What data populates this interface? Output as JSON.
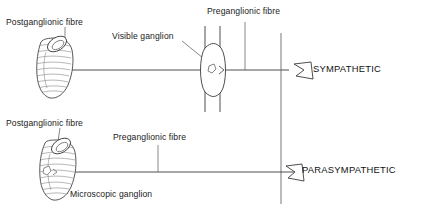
{
  "diagram": {
    "stroke_color": "#3a3a3a",
    "text_color": "#1a1a1a",
    "background_color": "#ffffff",
    "rows": [
      {
        "id": "sympathetic",
        "system_label": "SYMPATHETIC",
        "labels": {
          "postganglionic": "Postganglionic fibre",
          "preganglionic": "Preganglionic fibre",
          "ganglion": "Visible ganglion"
        },
        "ganglion_type": "visible",
        "ganglion_position": "remote from organ"
      },
      {
        "id": "parasympathetic",
        "system_label": "PARASYMPATHETIC",
        "labels": {
          "postganglionic": "Postganglionic fibre",
          "preganglionic": "Preganglionic fibre",
          "ganglion": "Microscopic ganglion"
        },
        "ganglion_type": "microscopic",
        "ganglion_position": "within organ wall"
      }
    ],
    "icons": {
      "organ": "curved-hollow-organ-icon",
      "ganglion": "spindle-ganglion-icon",
      "flag": "pentagon-flag-icon",
      "cns_boundary": "vertical-boundary-line"
    }
  }
}
